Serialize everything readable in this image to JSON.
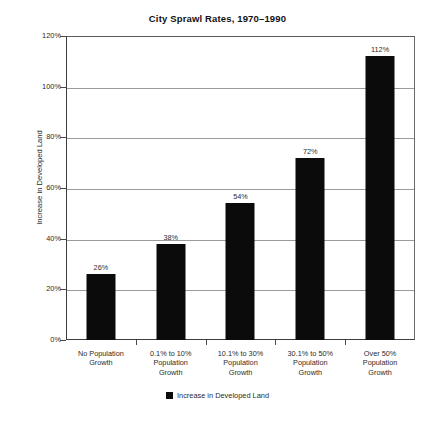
{
  "chart_data": {
    "type": "bar",
    "title": "City Sprawl Rates, 1970–1990",
    "xlabel": "",
    "ylabel": "Increase in Developed Land",
    "categories": [
      "No Population Growth",
      "0.1% to 10% Population Growth",
      "10.1% to 30% Population Growth",
      "30.1% to 50% Population Growth",
      "Over 50% Population Growth"
    ],
    "category_lines": [
      [
        "No Population",
        "Growth"
      ],
      [
        "0.1% to 10%",
        "Population",
        "Growth"
      ],
      [
        "10.1% to 30%",
        "Population",
        "Growth"
      ],
      [
        "30.1% to 50%",
        "Population",
        "Growth"
      ],
      [
        "Over 50%",
        "Population",
        "Growth"
      ]
    ],
    "values": [
      26,
      38,
      54,
      72,
      112
    ],
    "value_labels": [
      "26%",
      "38%",
      "54%",
      "72%",
      "112%"
    ],
    "ylim": [
      0,
      120
    ],
    "yticks": [
      0,
      20,
      40,
      60,
      80,
      100,
      120
    ],
    "ytick_labels": [
      "0%",
      "20%",
      "40%",
      "60%",
      "80%",
      "100%",
      "120%"
    ],
    "grid": true,
    "legend_position": "bottom",
    "series": [
      {
        "name": "Increase in Developed Land",
        "color": "#0b0b0b",
        "values": [
          26,
          38,
          54,
          72,
          112
        ]
      }
    ],
    "colors": {
      "bar": "#0b0b0b",
      "gridline": "#9b9b9b",
      "axis": "#3d3d3d",
      "background": "#ffffff",
      "text": "#2b2b2b"
    }
  },
  "legend": {
    "entries": [
      {
        "label": "Increase in Developed Land"
      }
    ]
  }
}
